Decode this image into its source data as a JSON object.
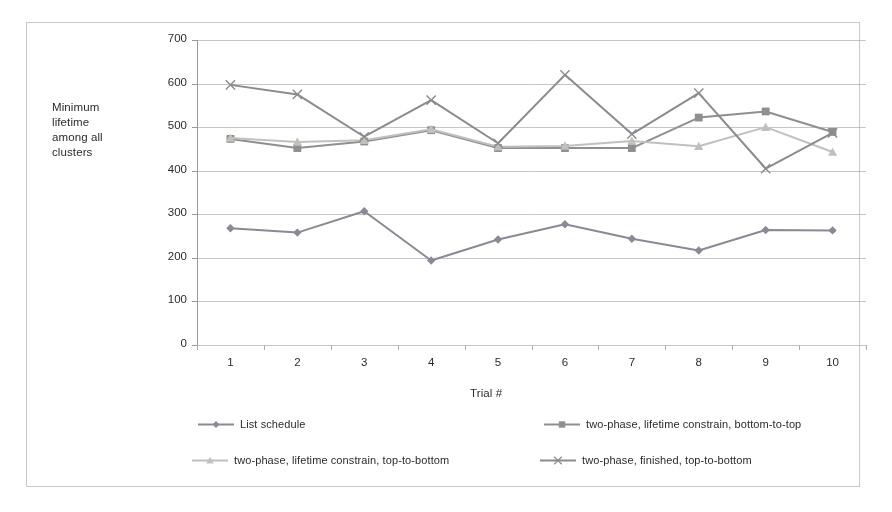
{
  "figure": {
    "border_color": "#c9c9c9",
    "background": "#ffffff"
  },
  "chart_data": {
    "type": "line",
    "title": "",
    "xlabel": "Trial #",
    "ylabel": "Minimum lifetime among all clusters",
    "ylabel_lines": [
      "Minimum",
      "lifetime",
      "among all",
      "clusters"
    ],
    "categories": [
      "1",
      "2",
      "3",
      "4",
      "5",
      "6",
      "7",
      "8",
      "9",
      "10"
    ],
    "x": [
      1,
      2,
      3,
      4,
      5,
      6,
      7,
      8,
      9,
      10
    ],
    "ylim": [
      0,
      700
    ],
    "yticks": [
      0,
      100,
      200,
      300,
      400,
      500,
      600,
      700
    ],
    "ytick_labels": [
      "0",
      "100",
      "200",
      "300",
      "400",
      "500",
      "600",
      "700"
    ],
    "grid": true,
    "grid_axis": "y",
    "grid_color": "#b8b8b8",
    "legend_position": "bottom",
    "legend_columns": 2,
    "series": [
      {
        "name": "List schedule",
        "marker": "diamond",
        "color": "#8a8a96",
        "values": [
          268,
          258,
          307,
          194,
          242,
          277,
          244,
          217,
          264,
          263
        ]
      },
      {
        "name": "two-phase, lifetime constrain, bottom-to-top",
        "marker": "square",
        "color": "#8f8f8f",
        "values": [
          473,
          452,
          467,
          493,
          452,
          452,
          452,
          522,
          536,
          489
        ]
      },
      {
        "name": "two-phase, lifetime constrain, top-to-bottom",
        "marker": "triangle",
        "color": "#c0c0bc",
        "values": [
          475,
          466,
          470,
          495,
          455,
          457,
          468,
          456,
          500,
          443
        ]
      },
      {
        "name": "two-phase, finished, top-to-bottom",
        "marker": "cross",
        "color": "#8a8a90",
        "values": [
          597,
          575,
          478,
          562,
          463,
          620,
          484,
          578,
          405,
          487
        ]
      }
    ]
  }
}
